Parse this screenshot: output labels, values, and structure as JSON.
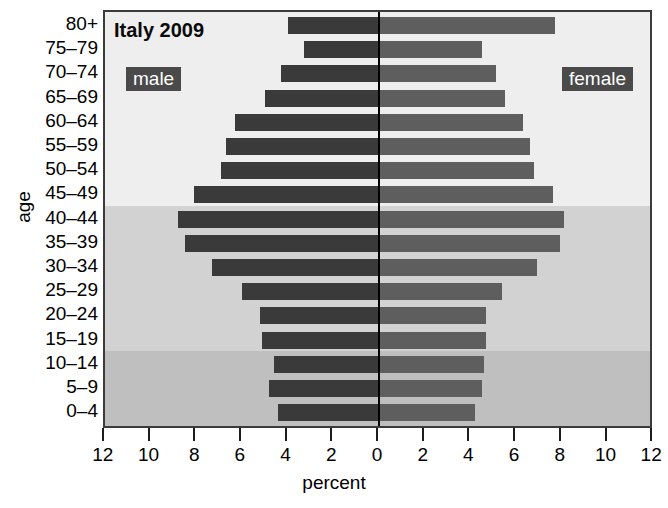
{
  "chart_data": {
    "type": "bar",
    "subtype": "population-pyramid",
    "title": "Italy 2009",
    "xlabel": "percent",
    "ylabel": "age",
    "xlim": [
      -12,
      12
    ],
    "xticks": [
      12,
      10,
      8,
      6,
      4,
      2,
      0,
      2,
      4,
      6,
      8,
      10,
      12
    ],
    "grid": false,
    "legend_position": "inside-top",
    "categories": [
      "0–4",
      "5–9",
      "10–14",
      "15–19",
      "20–24",
      "25–29",
      "30–34",
      "35–39",
      "40–44",
      "45–49",
      "50–54",
      "55–59",
      "60–64",
      "65–69",
      "70–74",
      "75–79",
      "80+"
    ],
    "series": [
      {
        "name": "male",
        "color": "#3a3a3a",
        "direction": "left",
        "values": [
          4.4,
          4.8,
          4.6,
          5.1,
          5.2,
          6.0,
          7.3,
          8.5,
          8.8,
          8.1,
          6.9,
          6.7,
          6.3,
          5.0,
          4.3,
          3.3,
          4.0
        ]
      },
      {
        "name": "female",
        "color": "#5e5e5e",
        "direction": "right",
        "values": [
          4.2,
          4.5,
          4.6,
          4.7,
          4.7,
          5.4,
          6.9,
          7.9,
          8.1,
          7.6,
          6.8,
          6.6,
          6.3,
          5.5,
          5.1,
          4.5,
          7.7
        ]
      }
    ],
    "bands": [
      {
        "label": "older",
        "from_category": "45–49",
        "to_category": "80+",
        "color": "#eeeeee"
      },
      {
        "label": "working",
        "from_category": "15–19",
        "to_category": "40–44",
        "color": "#d2d2d2"
      },
      {
        "label": "youth",
        "from_category": "0–4",
        "to_category": "10–14",
        "color": "#bfbfbf"
      }
    ]
  },
  "labels": {
    "title": "Italy 2009",
    "male_tag": "male",
    "female_tag": "female",
    "x_axis_title": "percent",
    "y_axis_title": "age"
  }
}
